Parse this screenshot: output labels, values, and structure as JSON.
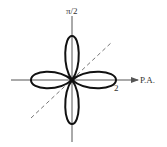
{
  "diagram": {
    "type": "polar-rose",
    "equation_form": "r = 2 cos(2θ)",
    "petals": 4,
    "labels": {
      "vertical_axis": "π/2",
      "horizontal_axis": "P.A.",
      "radius_tick": "2"
    },
    "colors": {
      "curve": "#111111",
      "axes": "#555555",
      "dashed_line": "#777777",
      "background": "#ffffff"
    },
    "geometry": {
      "origin": [
        72,
        80
      ],
      "petal_length_px": 44,
      "dashed_line_angle_deg": 43
    }
  }
}
